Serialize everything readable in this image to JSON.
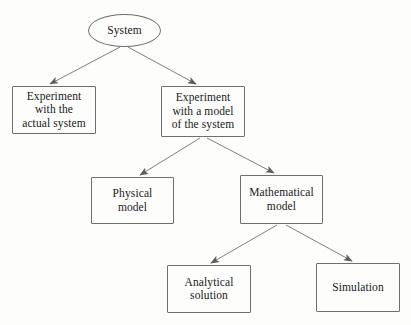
{
  "diagram": {
    "background_color": "#fdfdfc",
    "stroke_color": "#6f6f6f",
    "text_color": "#1a1a1a",
    "nodes": [
      {
        "id": "system",
        "label": "System",
        "shape": "ellipse",
        "x": 88,
        "y": 14,
        "width": 73,
        "height": 33
      },
      {
        "id": "experiment-actual",
        "label": "Experiment\nwith the\nactual system",
        "shape": "rectangle",
        "x": 12,
        "y": 86,
        "width": 84,
        "height": 48
      },
      {
        "id": "experiment-model",
        "label": "Experiment\nwith a model\nof the system",
        "shape": "rectangle",
        "x": 161,
        "y": 86,
        "width": 84,
        "height": 51
      },
      {
        "id": "physical-model",
        "label": "Physical\nmodel",
        "shape": "rectangle",
        "x": 91,
        "y": 177,
        "width": 83,
        "height": 47
      },
      {
        "id": "mathematical-model",
        "label": "Mathematical\nmodel",
        "shape": "rectangle",
        "x": 240,
        "y": 175,
        "width": 83,
        "height": 49
      },
      {
        "id": "analytical-solution",
        "label": "Analytical\nsolution",
        "shape": "rectangle",
        "x": 167,
        "y": 265,
        "width": 84,
        "height": 48
      },
      {
        "id": "simulation",
        "label": "Simulation",
        "shape": "rectangle",
        "x": 316,
        "y": 263,
        "width": 84,
        "height": 49
      }
    ],
    "edges": [
      {
        "id": "system-to-experiment-actual",
        "from": "system",
        "to": "experiment-actual",
        "x1": 120,
        "y1": 47,
        "x2": 50,
        "y2": 84
      },
      {
        "id": "system-to-experiment-model",
        "from": "system",
        "to": "experiment-model",
        "x1": 128,
        "y1": 47,
        "x2": 196,
        "y2": 84
      },
      {
        "id": "experiment-model-to-physical-model",
        "from": "experiment-model",
        "to": "physical-model",
        "x1": 200,
        "y1": 138,
        "x2": 140,
        "y2": 175
      },
      {
        "id": "experiment-model-to-mathematical-model",
        "from": "experiment-model",
        "to": "mathematical-model",
        "x1": 207,
        "y1": 138,
        "x2": 274,
        "y2": 173
      },
      {
        "id": "mathematical-model-to-analytical-solution",
        "from": "mathematical-model",
        "to": "analytical-solution",
        "x1": 277,
        "y1": 225,
        "x2": 211,
        "y2": 263
      },
      {
        "id": "mathematical-model-to-simulation",
        "from": "mathematical-model",
        "to": "simulation",
        "x1": 286,
        "y1": 225,
        "x2": 352,
        "y2": 261
      }
    ]
  }
}
